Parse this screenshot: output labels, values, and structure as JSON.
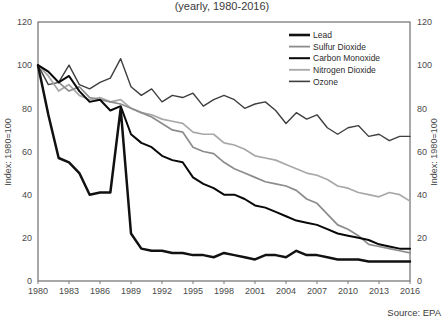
{
  "title": {
    "subtitle": "(yearly, 1980-2016)"
  },
  "source": {
    "label": "Source: EPA"
  },
  "axes": {
    "left_title": "Index: 1980=100",
    "right_title": "Index: 1980=100",
    "y_ticks": [
      0,
      20,
      40,
      60,
      80,
      100,
      120
    ],
    "x_ticks": [
      "1980",
      "1983",
      "1986",
      "1989",
      "1992",
      "1995",
      "1998",
      "2001",
      "2004",
      "2007",
      "2010",
      "2013",
      "2016"
    ]
  },
  "legend": {
    "position": "top-right",
    "entries": [
      {
        "label": "Lead",
        "color": "#111111",
        "width": 2.6
      },
      {
        "label": "Sulfur Dioxide",
        "color": "#8c8c8c",
        "width": 1.8
      },
      {
        "label": "Carbon Monoxide",
        "color": "#080808",
        "width": 2.0
      },
      {
        "label": "Nitrogen Dioxide",
        "color": "#a8a8a8",
        "width": 1.8
      },
      {
        "label": "Ozone",
        "color": "#3f3f3f",
        "width": 1.6
      }
    ]
  },
  "colors": {
    "lead": "#111111",
    "sulfur_dioxide": "#8c8c8c",
    "carbon_monoxide": "#080808",
    "nitrogen_dioxide": "#a8a8a8",
    "ozone": "#3f3f3f",
    "frame": "#6e6e6e",
    "background": "#ffffff"
  },
  "chart_data": {
    "type": "line",
    "title": "(yearly, 1980-2016)",
    "xlabel": "",
    "ylabel": "Index: 1980=100",
    "ylim": [
      0,
      120
    ],
    "xlim": [
      1980,
      2016
    ],
    "grid": false,
    "legend_position": "top-right",
    "x": [
      1980,
      1981,
      1982,
      1983,
      1984,
      1985,
      1986,
      1987,
      1988,
      1989,
      1990,
      1991,
      1992,
      1993,
      1994,
      1995,
      1996,
      1997,
      1998,
      1999,
      2000,
      2001,
      2002,
      2003,
      2004,
      2005,
      2006,
      2007,
      2008,
      2009,
      2010,
      2011,
      2012,
      2013,
      2014,
      2015,
      2016
    ],
    "series": [
      {
        "name": "Lead",
        "color": "#111111",
        "values": [
          100,
          77,
          57,
          55,
          50,
          40,
          41,
          41,
          80,
          22,
          15,
          14,
          14,
          13,
          13,
          12,
          12,
          11,
          13,
          12,
          11,
          10,
          12,
          12,
          11,
          14,
          12,
          12,
          11,
          10,
          10,
          10,
          9,
          9,
          9,
          9,
          9
        ]
      },
      {
        "name": "Sulfur Dioxide",
        "color": "#8c8c8c",
        "values": [
          100,
          97,
          92,
          88,
          90,
          85,
          84,
          83,
          82,
          80,
          78,
          76,
          73,
          70,
          69,
          62,
          60,
          59,
          55,
          52,
          50,
          48,
          46,
          45,
          44,
          42,
          38,
          36,
          31,
          26,
          24,
          21,
          17,
          16,
          15,
          14,
          13
        ]
      },
      {
        "name": "Carbon Monoxide",
        "color": "#080808",
        "values": [
          100,
          97,
          92,
          95,
          88,
          83,
          84,
          79,
          81,
          68,
          64,
          62,
          58,
          56,
          55,
          48,
          45,
          43,
          40,
          40,
          38,
          35,
          34,
          32,
          30,
          28,
          27,
          26,
          24,
          22,
          21,
          20,
          19,
          17,
          16,
          15,
          15
        ]
      },
      {
        "name": "Nitrogen Dioxide",
        "color": "#a8a8a8",
        "values": [
          100,
          95,
          88,
          91,
          86,
          84,
          85,
          83,
          84,
          80,
          78,
          77,
          75,
          74,
          73,
          69,
          68,
          68,
          64,
          63,
          61,
          58,
          57,
          56,
          54,
          52,
          50,
          49,
          47,
          44,
          43,
          41,
          40,
          39,
          41,
          40,
          37
        ]
      },
      {
        "name": "Ozone",
        "color": "#3f3f3f",
        "values": [
          100,
          91,
          92,
          100,
          91,
          89,
          92,
          94,
          103,
          90,
          86,
          89,
          83,
          86,
          85,
          87,
          81,
          84,
          86,
          84,
          80,
          82,
          83,
          79,
          73,
          78,
          75,
          77,
          71,
          68,
          71,
          72,
          67,
          68,
          65,
          67,
          67
        ]
      }
    ]
  }
}
